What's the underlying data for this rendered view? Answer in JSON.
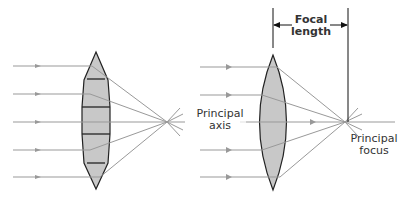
{
  "diagram": {
    "labels": {
      "focal_length_line1": "Focal",
      "focal_length_line2": "length",
      "principal_axis_line1": "Principal",
      "principal_axis_line2": "axis",
      "principal_focus_line1": "Principal",
      "principal_focus_line2": "focus"
    },
    "colors": {
      "ray": "#999999",
      "lens_fill": "#c8c8c8",
      "lens_stroke": "#222222"
    }
  }
}
